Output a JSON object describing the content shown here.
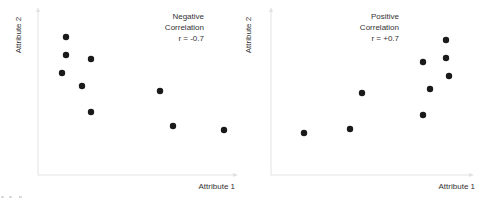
{
  "chart_data": [
    {
      "type": "scatter",
      "title": "Negative Correlation",
      "annotation": [
        "Negative",
        "Correlation",
        "r = -0.7"
      ],
      "r": -0.7,
      "xlabel": "Attribute 1",
      "ylabel": "Attribute 2",
      "grid": false,
      "axis_ticks": false,
      "points_px": [
        {
          "x": 66,
          "y": 37
        },
        {
          "x": 66,
          "y": 55
        },
        {
          "x": 91,
          "y": 59
        },
        {
          "x": 62,
          "y": 73
        },
        {
          "x": 82,
          "y": 86
        },
        {
          "x": 91,
          "y": 112
        },
        {
          "x": 160,
          "y": 91
        },
        {
          "x": 173,
          "y": 126
        },
        {
          "x": 224,
          "y": 130
        }
      ],
      "points_relative": [
        {
          "x": 0.15,
          "y": 0.83
        },
        {
          "x": 0.15,
          "y": 0.72
        },
        {
          "x": 0.28,
          "y": 0.7
        },
        {
          "x": 0.13,
          "y": 0.61
        },
        {
          "x": 0.23,
          "y": 0.54
        },
        {
          "x": 0.28,
          "y": 0.38
        },
        {
          "x": 0.65,
          "y": 0.51
        },
        {
          "x": 0.72,
          "y": 0.3
        },
        {
          "x": 0.98,
          "y": 0.28
        }
      ]
    },
    {
      "type": "scatter",
      "title": "Positive Correlation",
      "annotation": [
        "Positive",
        "Correlation",
        "r = +0.7"
      ],
      "r": 0.7,
      "xlabel": "Attribute 1",
      "ylabel": "Attribute 2",
      "grid": false,
      "axis_ticks": false,
      "points_px": [
        {
          "x": 304,
          "y": 133
        },
        {
          "x": 350,
          "y": 129
        },
        {
          "x": 362,
          "y": 93
        },
        {
          "x": 423,
          "y": 62
        },
        {
          "x": 430,
          "y": 89
        },
        {
          "x": 423,
          "y": 115
        },
        {
          "x": 446,
          "y": 40
        },
        {
          "x": 446,
          "y": 58
        },
        {
          "x": 449,
          "y": 76
        }
      ],
      "points_relative": [
        {
          "x": 0.17,
          "y": 0.25
        },
        {
          "x": 0.4,
          "y": 0.28
        },
        {
          "x": 0.46,
          "y": 0.49
        },
        {
          "x": 0.76,
          "y": 0.68
        },
        {
          "x": 0.79,
          "y": 0.52
        },
        {
          "x": 0.76,
          "y": 0.36
        },
        {
          "x": 0.87,
          "y": 0.81
        },
        {
          "x": 0.87,
          "y": 0.7
        },
        {
          "x": 0.89,
          "y": 0.6
        }
      ]
    }
  ],
  "charts": [
    {
      "ylabel": "Attribute 2",
      "xlabel": "Attribute 1",
      "annotation": {
        "line1": "Negative",
        "line2": "Correlation",
        "line3": "r = -0.7"
      }
    },
    {
      "ylabel": "Attribute 2",
      "xlabel": "Attribute 1",
      "annotation": {
        "line1": "Positive",
        "line2": "Correlation",
        "line3": "r = +0.7"
      }
    }
  ],
  "colors": {
    "axis": "#e2e2e2",
    "dot": "#1a1a1a",
    "text": "#333333",
    "background": "#ffffff"
  }
}
